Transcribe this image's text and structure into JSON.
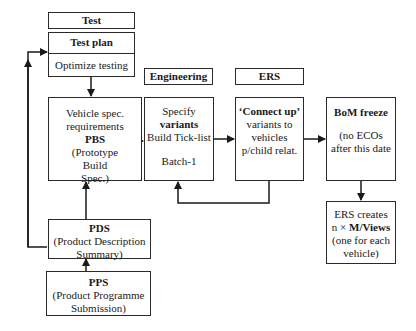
{
  "test": {
    "header": "Test",
    "plan_title": "Test plan",
    "plan_body": "Optimize testing"
  },
  "pbs": {
    "lines": [
      "Vehicle spec.",
      "requirements"
    ],
    "title": "PBS",
    "sub": [
      "(Prototype",
      "Build",
      "Spec.)"
    ]
  },
  "pds": {
    "title": "PDS",
    "sub": [
      "(Product Description",
      "Summary)"
    ]
  },
  "pps": {
    "title": "PPS",
    "sub": [
      "(Product Programme",
      "Submission)"
    ]
  },
  "engineering": {
    "header": "Engineering",
    "line1": "Specify",
    "bold": "variants",
    "line3": "Build Tick-list",
    "line4": "Batch-1"
  },
  "ers": {
    "header": "ERS",
    "bold": "‘Connect up’",
    "lines": [
      "variants to",
      "vehicles",
      "p/child relat."
    ]
  },
  "bom": {
    "title": "BoM freeze",
    "lines": [
      "(no ECOs",
      "after this date"
    ]
  },
  "mviews": {
    "line1": "ERS creates",
    "prefix": "n ×",
    "bold": "M/Views",
    "lines": [
      "(one for each",
      "vehicle)"
    ]
  }
}
